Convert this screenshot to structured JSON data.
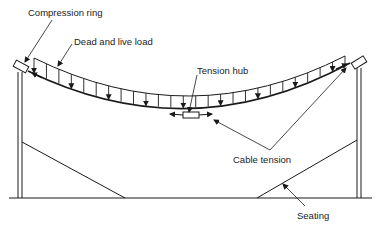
{
  "diagram": {
    "type": "tension-roof-cable-section",
    "labels": {
      "compression_ring": "Compression ring",
      "dead_live_load": "Dead and live load",
      "tension_hub": "Tension hub",
      "cable_tension": "Cable tension",
      "seating": "Seating"
    },
    "colors": {
      "line": "#1a1a1a",
      "background": "#ffffff"
    },
    "load_arrow_count": 26
  }
}
